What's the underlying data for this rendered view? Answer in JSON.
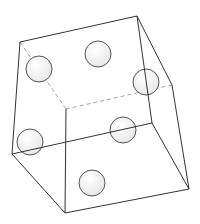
{
  "diagram": {
    "type": "3d-cube-wireframe-with-dots",
    "stroke_color": "#333333",
    "dashed_color": "#999999",
    "dot_fill": "#f2f2f2",
    "dot_stroke": "#555555",
    "vertices": {
      "A": [
        20,
        42
      ],
      "B": [
        137,
        16
      ],
      "C": [
        172,
        85
      ],
      "D": [
        66,
        109
      ],
      "E": [
        152,
        123
      ],
      "F": [
        12,
        154
      ],
      "G": [
        65,
        213
      ],
      "H": [
        189,
        189
      ]
    },
    "solid_edges": [
      [
        "A",
        "B"
      ],
      [
        "B",
        "C"
      ],
      [
        "B",
        "E"
      ],
      [
        "A",
        "F"
      ],
      [
        "F",
        "E"
      ],
      [
        "F",
        "G"
      ],
      [
        "D",
        "G"
      ],
      [
        "C",
        "H"
      ],
      [
        "E",
        "H"
      ],
      [
        "G",
        "H"
      ]
    ],
    "dashed_edges": [
      [
        "A",
        "D"
      ],
      [
        "D",
        "C"
      ]
    ],
    "dots": [
      {
        "cx": 39,
        "cy": 69,
        "r": 13
      },
      {
        "cx": 98,
        "cy": 54,
        "r": 13
      },
      {
        "cx": 146,
        "cy": 82,
        "r": 13
      },
      {
        "cx": 30,
        "cy": 142,
        "r": 13
      },
      {
        "cx": 123,
        "cy": 130,
        "r": 13
      },
      {
        "cx": 92,
        "cy": 183,
        "r": 13
      }
    ]
  }
}
